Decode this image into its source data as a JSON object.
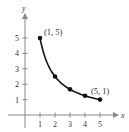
{
  "chart_data": {
    "type": "line",
    "title": "",
    "xlabel": "x",
    "ylabel": "y",
    "xlim": [
      0,
      5.5
    ],
    "ylim": [
      0,
      5.6
    ],
    "grid": false,
    "x_ticks": [
      "1",
      "2",
      "3",
      "4",
      "5"
    ],
    "y_ticks": [
      "1",
      "2",
      "3",
      "4",
      "5"
    ],
    "series": [
      {
        "name": "y = 5/x",
        "x": [
          1,
          2,
          3,
          4,
          5
        ],
        "y": [
          5,
          2.5,
          1.667,
          1.25,
          1
        ],
        "markers": true
      }
    ],
    "annotations": [
      {
        "text": "(1, 5)",
        "x": 1,
        "y": 5
      },
      {
        "text": "(5, 1)",
        "x": 5,
        "y": 1
      }
    ]
  },
  "colors": {
    "curve": "#111111",
    "axis": "#888888",
    "text": "#333333"
  }
}
